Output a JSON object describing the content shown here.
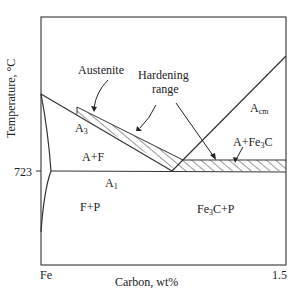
{
  "diagram": {
    "y_axis": {
      "label": "Temperature, °C",
      "tick": "723"
    },
    "x_axis": {
      "label": "Carbon, wt%",
      "left_tick": "Fe",
      "right_tick": "1.5"
    },
    "callouts": {
      "austenite": "Austenite",
      "hardening_1": "Hardening",
      "hardening_2": "range"
    },
    "lines": {
      "a3": "A",
      "a3_sub": "3",
      "a1": "A",
      "a1_sub": "1",
      "acm": "A",
      "acm_sub": "cm"
    },
    "regions": {
      "a_f": "A+F",
      "f_p": "F+P",
      "a_fe3c_pre": "A+Fe",
      "a_fe3c_sub": "3",
      "a_fe3c_post": "C",
      "fe3c_p_pre": "Fe",
      "fe3c_p_sub": "3",
      "fe3c_p_post": "C+P"
    },
    "colors": {
      "line": "#333333",
      "background": "#ffffff"
    }
  }
}
